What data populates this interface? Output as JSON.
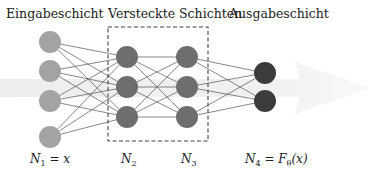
{
  "diagram": {
    "type": "neural-network",
    "layer_titles": {
      "input": "Eingabeschicht",
      "hidden": "Versteckte Schichten",
      "output": "Ausgabeschicht"
    },
    "layer_labels": {
      "n1": {
        "base": "N",
        "sub": "1",
        "rest": " = x"
      },
      "n2": {
        "base": "N",
        "sub": "2",
        "rest": ""
      },
      "n3": {
        "base": "N",
        "sub": "3",
        "rest": ""
      },
      "n4": {
        "base": "N",
        "sub": "4",
        "rest": " = F",
        "sub2": "θ",
        "rest2": "(x)"
      }
    },
    "layers": [
      {
        "name": "input",
        "nodes": 4,
        "color": "#a3a3a3"
      },
      {
        "name": "hidden-1",
        "nodes": 3,
        "color": "#6e6e6e"
      },
      {
        "name": "hidden-2",
        "nodes": 3,
        "color": "#6e6e6e"
      },
      {
        "name": "output",
        "nodes": 2,
        "color": "#3c3c3c"
      }
    ],
    "colors": {
      "edge": "#555555",
      "dashed_box": "#444444",
      "arrow": "#e8e8e8"
    }
  }
}
